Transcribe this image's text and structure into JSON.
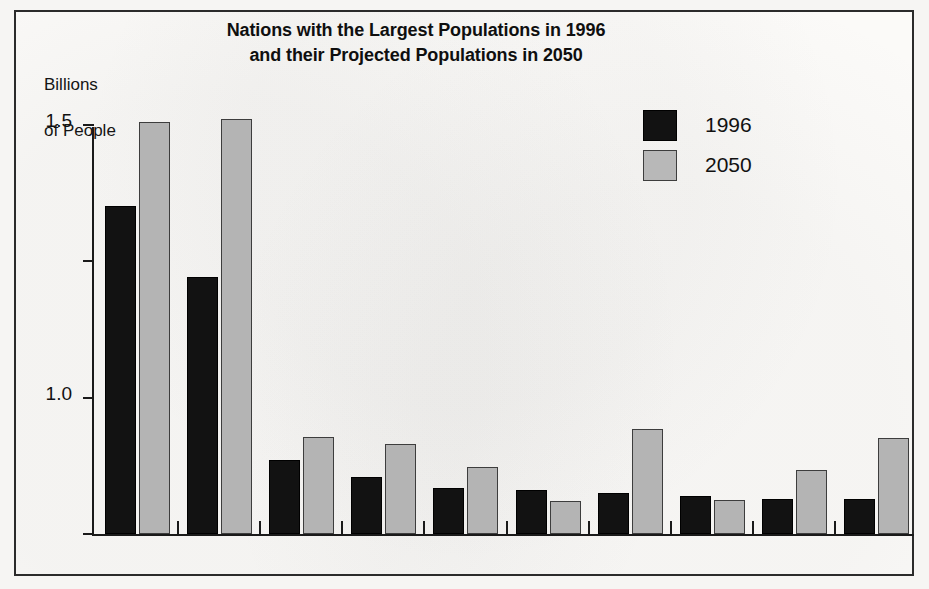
{
  "chart_data": {
    "type": "bar",
    "title": "Nations with the Largest Populations in 1996 and their Projected Populations in 2050",
    "title_line1": "Nations with the Largest Populations in 1996",
    "title_line2": "and their Projected Populations in 2050",
    "ylabel": "Billions\nof People",
    "ylabel_line1": "Billions",
    "ylabel_line2": "of People",
    "xlabel": "",
    "ylim": [
      0.0,
      1.6
    ],
    "yticks": [
      "0.0",
      "0.5",
      "1.0",
      "1.5"
    ],
    "ytick_values": [
      0.0,
      0.5,
      1.0,
      1.5
    ],
    "grid": false,
    "legend_position": "upper right",
    "categories": [
      "China",
      "India",
      "USA",
      "Indonesia",
      "Brazil",
      "Russia",
      "Pakistan",
      "Japan",
      "Bangladesh",
      "Nigeria"
    ],
    "series": [
      {
        "name": "1996",
        "color": "#121212",
        "values": [
          1.2,
          0.94,
          0.27,
          0.21,
          0.17,
          0.16,
          0.15,
          0.14,
          0.13,
          0.13
        ]
      },
      {
        "name": "2050",
        "color": "#b4b4b4",
        "values": [
          1.51,
          1.52,
          0.355,
          0.33,
          0.245,
          0.12,
          0.385,
          0.125,
          0.235,
          0.35
        ]
      }
    ]
  },
  "legend": {
    "items": [
      {
        "label": "1996",
        "swatch": "y1996"
      },
      {
        "label": "2050",
        "swatch": "y2050"
      }
    ]
  }
}
